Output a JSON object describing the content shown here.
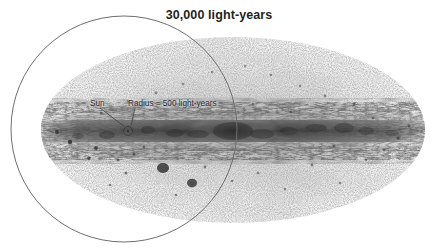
{
  "figure": {
    "kind": "all-sky-map",
    "title": "30,000 light-years",
    "background_color": "#ffffff",
    "width": 438,
    "height": 249
  },
  "annotations": {
    "sun_label": "Sun",
    "radius_label": "Radius = 500 light-years"
  },
  "sky_map": {
    "projection": "aitoff-ellipse",
    "center_x": 233,
    "center_y": 130,
    "radius_x": 192,
    "radius_y": 93,
    "haze_color": "#e6e6e6",
    "plane_color": "#3a3a3a",
    "description": "grayscale all-sky star map with dense dark galactic plane band"
  },
  "overlay_circle": {
    "name": "30000-light-year-circle",
    "center_x": 124,
    "center_y": 129,
    "radius": 113,
    "stroke_color": "#6e6e70",
    "stroke_width": 1
  },
  "sun_marker": {
    "center_x": 128,
    "center_y": 131,
    "radius": 4.5,
    "stroke_color": "#4a4a4a"
  },
  "leader_lines": {
    "sun": {
      "x1": 100,
      "y1": 108,
      "x2": 125,
      "y2": 127,
      "color": "#4a4a4a"
    },
    "radius": {
      "x1": 135,
      "y1": 108,
      "x2": 131,
      "y2": 126,
      "color": "#4a4a4a"
    }
  },
  "colors": {
    "title_text": "#231f20",
    "annotation_text": "#2b2b2b",
    "circle_stroke": "#6e6e70",
    "page_background": "#ffffff"
  }
}
